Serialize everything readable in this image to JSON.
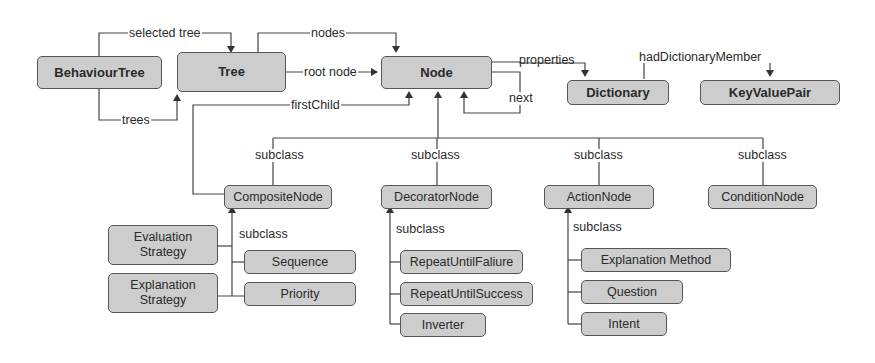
{
  "diagram": {
    "type": "ontology-class-diagram",
    "nodes": {
      "behaviour_tree": "BehaviourTree",
      "tree": "Tree",
      "node": "Node",
      "dictionary": "Dictionary",
      "key_value_pair": "KeyValuePair",
      "composite_node": "CompositeNode",
      "decorator_node": "DecoratorNode",
      "action_node": "ActionNode",
      "condition_node": "ConditionNode",
      "evaluation_strategy": "Evaluation Strategy",
      "explanation_strategy": "Explanation Strategy",
      "sequence": "Sequence",
      "priority": "Priority",
      "repeat_until_failure": "RepeatUntilFaliure",
      "repeat_until_success": "RepeatUntilSuccess",
      "inverter": "Inverter",
      "explanation_method": "Explanation Method",
      "question": "Question",
      "intent": "Intent"
    },
    "edge_labels": {
      "selected_tree": "selected tree",
      "trees": "trees",
      "nodes": "nodes",
      "root_node": "root node",
      "first_child": "firstChild",
      "properties": "properties",
      "next": "next",
      "had_dictionary_member": "hadDictionaryMember",
      "subclass_composite": "subclass",
      "subclass_decorator": "subclass",
      "subclass_action": "subclass",
      "subclass_condition": "subclass",
      "subclass_composite_children": "subclass",
      "subclass_decorator_children": "subclass",
      "subclass_action_children": "subclass"
    },
    "edges": [
      {
        "from": "BehaviourTree",
        "to": "Tree",
        "label": "selected tree"
      },
      {
        "from": "BehaviourTree",
        "to": "Tree",
        "label": "trees"
      },
      {
        "from": "Tree",
        "to": "Node",
        "label": "nodes"
      },
      {
        "from": "Tree",
        "to": "Node",
        "label": "root node"
      },
      {
        "from": "CompositeNode",
        "to": "Node",
        "label": "firstChild"
      },
      {
        "from": "Node",
        "to": "Dictionary",
        "label": "properties"
      },
      {
        "from": "Node",
        "to": "Node",
        "label": "next"
      },
      {
        "from": "Dictionary",
        "to": "KeyValuePair",
        "label": "hadDictionaryMember"
      },
      {
        "from": "CompositeNode",
        "to": "Node",
        "label": "subclass"
      },
      {
        "from": "DecoratorNode",
        "to": "Node",
        "label": "subclass"
      },
      {
        "from": "ActionNode",
        "to": "Node",
        "label": "subclass"
      },
      {
        "from": "ConditionNode",
        "to": "Node",
        "label": "subclass"
      },
      {
        "from": "Sequence",
        "to": "CompositeNode",
        "label": "subclass"
      },
      {
        "from": "Priority",
        "to": "CompositeNode",
        "label": "subclass"
      },
      {
        "from": "Evaluation Strategy",
        "to": "CompositeNode",
        "label": ""
      },
      {
        "from": "Explanation Strategy",
        "to": "CompositeNode",
        "label": ""
      },
      {
        "from": "RepeatUntilFaliure",
        "to": "DecoratorNode",
        "label": "subclass"
      },
      {
        "from": "RepeatUntilSuccess",
        "to": "DecoratorNode",
        "label": "subclass"
      },
      {
        "from": "Inverter",
        "to": "DecoratorNode",
        "label": "subclass"
      },
      {
        "from": "Explanation Method",
        "to": "ActionNode",
        "label": "subclass"
      },
      {
        "from": "Question",
        "to": "ActionNode",
        "label": "subclass"
      },
      {
        "from": "Intent",
        "to": "ActionNode",
        "label": "subclass"
      }
    ],
    "colors": {
      "box_fill": "#cdcdcd",
      "box_border": "#555555",
      "line": "#444444",
      "text": "#2a2a2a"
    }
  }
}
